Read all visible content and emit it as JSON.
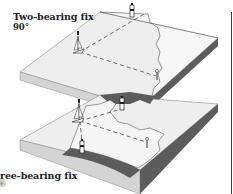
{
  "figure": {
    "type": "nautical position fix illustration",
    "panels": [
      {
        "title": "Two-bearing fix",
        "subtitle": "90°",
        "elements": [
          "boat",
          "lighthouse",
          "beacon",
          "bearing-lines",
          "coastline"
        ]
      },
      {
        "title": "ree-bearing fix",
        "subtitle": "°",
        "elements": [
          "boat",
          "lighthouse",
          "lighthouse",
          "beacon",
          "bearing-lines",
          "coastline"
        ]
      }
    ]
  },
  "colors": {
    "sea_top": "#efefef",
    "sea_side": "#c9c9c9",
    "land_top": "#f7f7f7",
    "land_side": "#5a5a5a",
    "line": "#333333",
    "text": "#222222"
  }
}
